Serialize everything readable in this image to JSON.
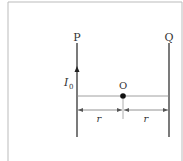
{
  "diagram": {
    "wire_left_label": "P",
    "wire_right_label": "Q",
    "current_label": "I",
    "current_subscript": "0",
    "point_label": "O",
    "distance_left_label": "r",
    "distance_right_label": "r"
  }
}
